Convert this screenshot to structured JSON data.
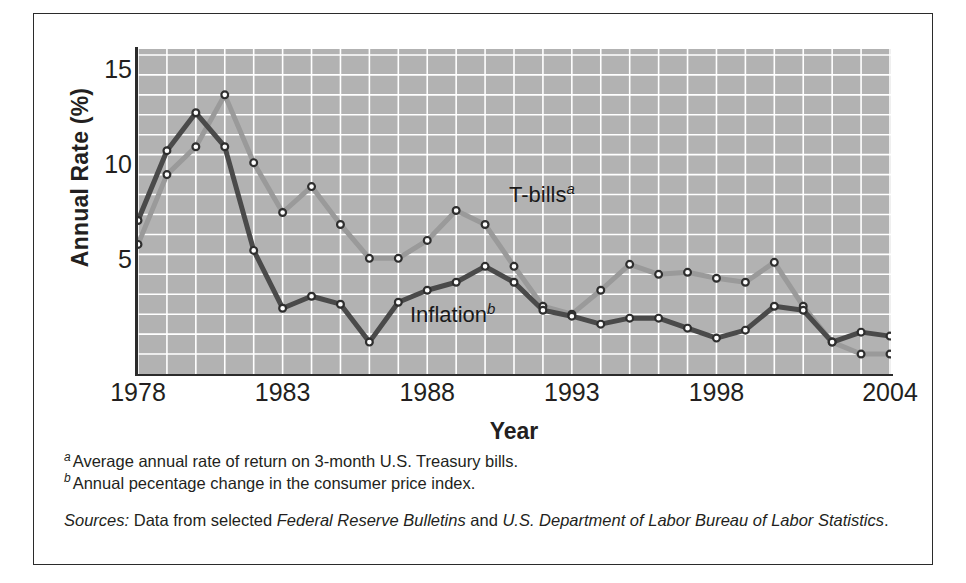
{
  "chart_data": {
    "type": "line",
    "title": "",
    "xlabel": "Year",
    "ylabel": "Annual Rate (%)",
    "xlim": [
      1978,
      2004
    ],
    "ylim": [
      0,
      16
    ],
    "yticks": [
      5,
      10,
      15
    ],
    "xticks": [
      1978,
      1983,
      1988,
      1993,
      1998,
      2004
    ],
    "grid": true,
    "grid_color": "#ffffff",
    "plot_background": "#b2b2b2",
    "legend_position": "inline-annotation",
    "x": [
      1978,
      1979,
      1980,
      1981,
      1982,
      1983,
      1984,
      1985,
      1986,
      1987,
      1988,
      1989,
      1990,
      1991,
      1992,
      1993,
      1994,
      1995,
      1996,
      1997,
      1998,
      1999,
      2000,
      2001,
      2002,
      2003,
      2004
    ],
    "series": [
      {
        "name": "T-bills",
        "label": "T-bills",
        "footnote_marker": "a",
        "color": "#9a9a9a",
        "marker": "open-circle",
        "values": [
          6.5,
          10.0,
          11.4,
          14.0,
          10.6,
          8.1,
          9.4,
          7.5,
          5.8,
          5.8,
          6.7,
          8.2,
          7.5,
          5.4,
          3.4,
          3.0,
          4.2,
          5.5,
          5.0,
          5.1,
          4.8,
          4.6,
          5.6,
          3.4,
          1.6,
          1.0,
          1.0
        ],
        "peak_year": 1981,
        "peak_value": 14.0
      },
      {
        "name": "Inflation",
        "label": "Inflation",
        "footnote_marker": "b",
        "color": "#4a4a4a",
        "marker": "open-circle",
        "values": [
          7.7,
          11.2,
          13.1,
          11.4,
          6.2,
          3.3,
          3.9,
          3.5,
          1.6,
          3.6,
          4.2,
          4.6,
          5.4,
          4.6,
          3.2,
          2.9,
          2.5,
          2.8,
          2.8,
          2.3,
          1.8,
          2.2,
          3.4,
          3.2,
          1.6,
          2.1,
          1.9
        ],
        "peak_year": 1980,
        "peak_value": 13.1
      }
    ]
  },
  "axes": {
    "y_title": "Annual Rate (%)",
    "x_title": "Year",
    "y_tick_labels": [
      "15",
      "10",
      "5"
    ],
    "x_tick_labels": [
      "1978",
      "1983",
      "1988",
      "1993",
      "1998",
      "2004"
    ]
  },
  "annotations": {
    "tbills_label": "T-bills",
    "tbills_marker": "a",
    "inflation_label": "Inflation",
    "inflation_marker": "b"
  },
  "footnotes": [
    {
      "marker": "a",
      "text": "Average annual rate of return on 3-month U.S. Treasury bills."
    },
    {
      "marker": "b",
      "text": "Annual pecentage change in the consumer price index."
    }
  ],
  "sources": {
    "lead": "Sources:",
    "part1": " Data from selected ",
    "pub1": "Federal Reserve Bulletins",
    "part2": " and ",
    "pub2": "U.S. Department of Labor Bureau of Labor Statistics",
    "part3": "."
  },
  "colors": {
    "tbills": "#9a9a9a",
    "inflation": "#4a4a4a",
    "plot_bg": "#b2b2b2",
    "grid": "#ffffff",
    "axis": "#2b2b2b",
    "text": "#231f20"
  }
}
